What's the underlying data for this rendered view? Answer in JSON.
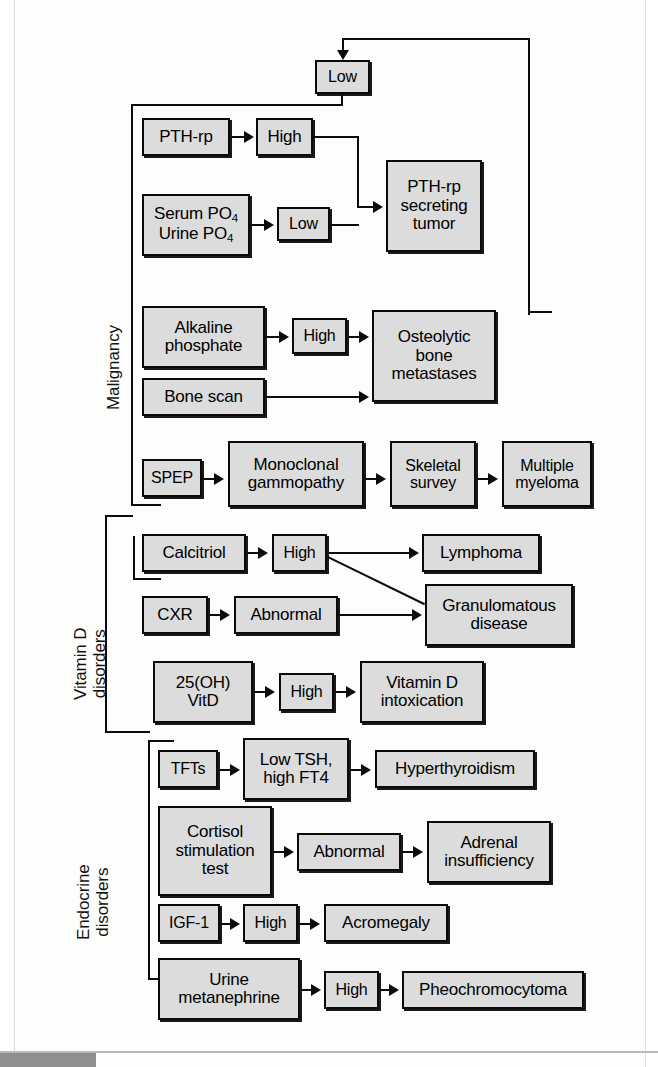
{
  "diagram": {
    "section_labels": [
      {
        "id": "malignancy",
        "text": "Malignancy"
      },
      {
        "id": "vitamin-d",
        "line1": "Vitamin D",
        "line2": "disorders"
      },
      {
        "id": "endocrine",
        "line1": "Endocrine",
        "line2": "disorders"
      }
    ],
    "nodes": {
      "top_low": {
        "label": "Low"
      },
      "pth_rp": {
        "label": "PTH-rp"
      },
      "pth_rp_high": {
        "label": "High"
      },
      "serum_urine_po4": {
        "line1": "Serum PO",
        "sub1": "4",
        "line2": "Urine PO",
        "sub2": "4"
      },
      "po4_low": {
        "label": "Low"
      },
      "pth_rp_tumor": {
        "line1": "PTH-rp",
        "line2": "secreting",
        "line3": "tumor"
      },
      "alkaline_phosphate": {
        "line1": "Alkaline",
        "line2": "phosphate"
      },
      "alk_high": {
        "label": "High"
      },
      "bone_scan": {
        "label": "Bone scan"
      },
      "osteolytic": {
        "line1": "Osteolytic",
        "line2": "bone",
        "line3": "metastases"
      },
      "spep": {
        "label": "SPEP"
      },
      "monoclonal": {
        "line1": "Monoclonal",
        "line2": "gammopathy"
      },
      "skeletal_survey": {
        "line1": "Skeletal",
        "line2": "survey"
      },
      "multiple_myeloma": {
        "line1": "Multiple",
        "line2": "myeloma"
      },
      "calcitriol": {
        "label": "Calcitriol"
      },
      "calcitriol_high": {
        "label": "High"
      },
      "lymphoma": {
        "label": "Lymphoma"
      },
      "cxr": {
        "label": "CXR"
      },
      "cxr_abnormal": {
        "label": "Abnormal"
      },
      "granulomatous": {
        "line1": "Granulomatous",
        "line2": "disease"
      },
      "vit_d_25oh": {
        "line1": "25(OH)",
        "line2": "VitD"
      },
      "vit_d_high": {
        "label": "High"
      },
      "vit_d_intox": {
        "line1": "Vitamin D",
        "line2": "intoxication"
      },
      "tfts": {
        "label": "TFTs"
      },
      "low_tsh": {
        "line1": "Low TSH,",
        "line2": "high FT4"
      },
      "hyperthyroidism": {
        "label": "Hyperthyroidism"
      },
      "cortisol_test": {
        "line1": "Cortisol",
        "line2": "stimulation",
        "line3": "test"
      },
      "cortisol_abnormal": {
        "label": "Abnormal"
      },
      "adrenal": {
        "line1": "Adrenal",
        "line2": "insufficiency"
      },
      "igf1": {
        "label": "IGF-1"
      },
      "igf1_high": {
        "label": "High"
      },
      "acromegaly": {
        "label": "Acromegaly"
      },
      "urine_metanephrine": {
        "line1": "Urine",
        "line2": "metanephrine"
      },
      "metanephrine_high": {
        "label": "High"
      },
      "pheo": {
        "label": "Pheochromocytoma"
      }
    },
    "colors": {
      "box_fill": "#dcdcdc",
      "box_stroke": "#0a0a0a",
      "connector": "#0c0c0c",
      "page_background": "#fdfdfc"
    }
  }
}
